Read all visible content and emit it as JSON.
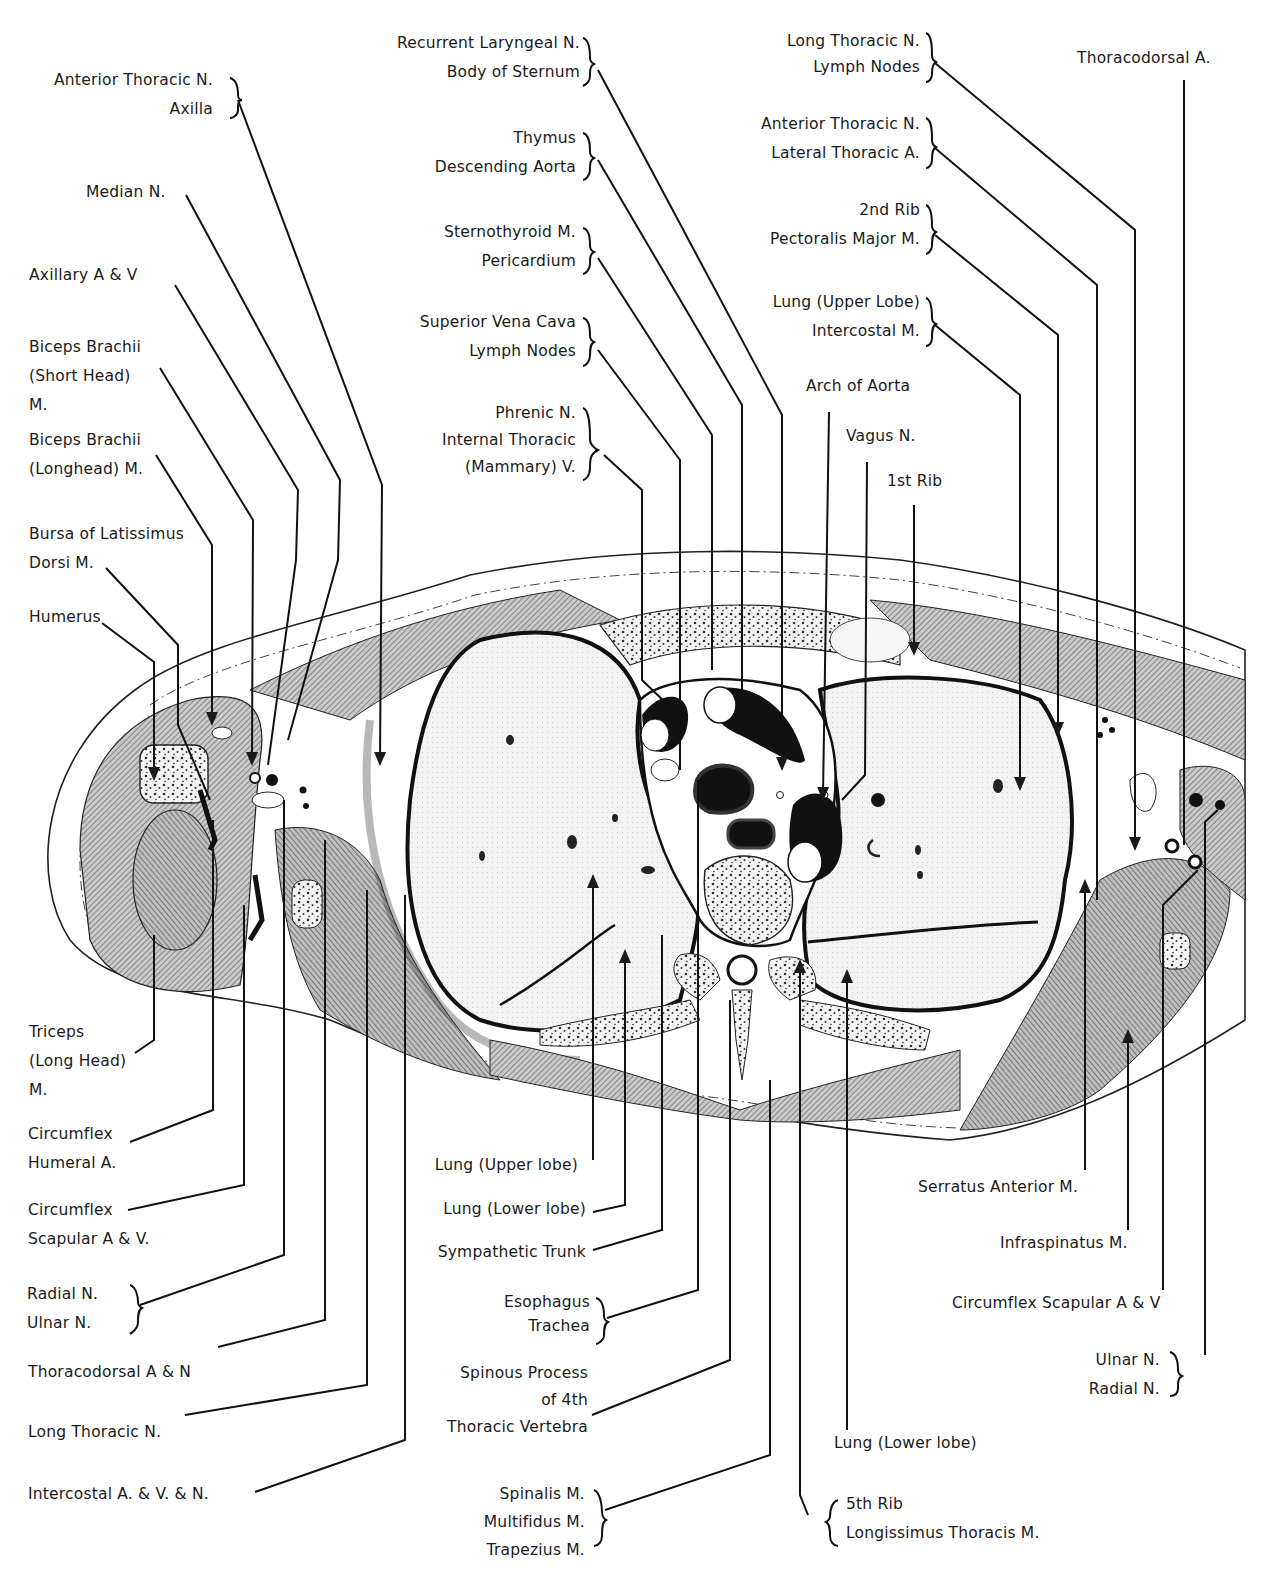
{
  "figure": {
    "type": "anatomical cross-section",
    "colors": {
      "ink": "#1a1a1a",
      "muscle_hatch": "#5a5a5a",
      "lung_fill": "#f2f2f2",
      "background": "#ffffff"
    }
  },
  "labels": {
    "left": [
      {
        "id": "ant-thoracic-axilla",
        "lines": [
          "Anterior Thoracic N.",
          "Axilla"
        ],
        "bracket": true
      },
      {
        "id": "median-n",
        "lines": [
          "Median N."
        ]
      },
      {
        "id": "axillary-av",
        "lines": [
          "Axillary A & V"
        ]
      },
      {
        "id": "biceps-short",
        "lines": [
          "Biceps Brachii",
          "(Short Head)",
          "M."
        ]
      },
      {
        "id": "biceps-long",
        "lines": [
          "Biceps Brachii",
          "(Longhead) M."
        ]
      },
      {
        "id": "bursa-latissimus",
        "lines": [
          "Bursa of Latissimus",
          "Dorsi M."
        ]
      },
      {
        "id": "humerus",
        "lines": [
          "Humerus"
        ]
      },
      {
        "id": "triceps-long",
        "lines": [
          "Triceps",
          "(Long Head)",
          "M."
        ]
      },
      {
        "id": "circumflex-humeral",
        "lines": [
          "Circumflex",
          "Humeral A."
        ]
      },
      {
        "id": "circumflex-scapular-left",
        "lines": [
          "Circumflex",
          "Scapular A & V."
        ]
      },
      {
        "id": "radial-ulnar-left",
        "lines": [
          "Radial N.",
          "Ulnar N."
        ],
        "bracket": true
      },
      {
        "id": "thoracodorsal-an",
        "lines": [
          "Thoracodorsal A & N"
        ]
      },
      {
        "id": "long-thoracic-left",
        "lines": [
          "Long Thoracic N."
        ]
      },
      {
        "id": "intercostal-avn",
        "lines": [
          "Intercostal A. & V. & N."
        ]
      }
    ],
    "top_center": [
      {
        "id": "recurrent-laryngeal",
        "lines": [
          "Recurrent Laryngeal N.",
          "Body of Sternum"
        ],
        "bracket": true
      },
      {
        "id": "thymus-aorta",
        "lines": [
          "Thymus",
          "Descending Aorta"
        ],
        "bracket": true
      },
      {
        "id": "sternothyroid",
        "lines": [
          "Sternothyroid M.",
          "Pericardium"
        ],
        "bracket": true
      },
      {
        "id": "svc-lymph",
        "lines": [
          "Superior Vena Cava",
          "Lymph Nodes"
        ],
        "bracket": true
      },
      {
        "id": "phrenic",
        "lines": [
          "Phrenic N.",
          "Internal Thoracic",
          "(Mammary) V."
        ],
        "bracket": true
      }
    ],
    "top_right": [
      {
        "id": "long-thoracic-lymph",
        "lines": [
          "Long Thoracic N.",
          "Lymph Nodes"
        ],
        "bracket": true
      },
      {
        "id": "thoracodorsal-a",
        "lines": [
          "Thoracodorsal A."
        ]
      },
      {
        "id": "ant-thoracic-lateral",
        "lines": [
          "Anterior Thoracic N.",
          "Lateral Thoracic A."
        ],
        "bracket": true
      },
      {
        "id": "rib2-pectoralis",
        "lines": [
          "2nd Rib",
          "Pectoralis Major M."
        ],
        "bracket": true
      },
      {
        "id": "lung-upper-intercostal",
        "lines": [
          "Lung (Upper Lobe)",
          "Intercostal M."
        ],
        "bracket": true
      },
      {
        "id": "arch-aorta",
        "lines": [
          "Arch of Aorta"
        ]
      },
      {
        "id": "vagus",
        "lines": [
          "Vagus N."
        ]
      },
      {
        "id": "rib1",
        "lines": [
          "1st Rib"
        ]
      }
    ],
    "bottom_center": [
      {
        "id": "lung-upper-lobe",
        "lines": [
          "Lung (Upper lobe)"
        ]
      },
      {
        "id": "lung-lower-lobe-left",
        "lines": [
          "Lung (Lower lobe)"
        ]
      },
      {
        "id": "sympathetic-trunk",
        "lines": [
          "Sympathetic Trunk"
        ]
      },
      {
        "id": "esophagus-trachea",
        "lines": [
          "Esophagus",
          "Trachea"
        ],
        "bracket": true
      },
      {
        "id": "spinous-process",
        "lines": [
          "Spinous Process",
          "of 4th",
          "Thoracic Vertebra"
        ]
      },
      {
        "id": "spinalis-group",
        "lines": [
          "Spinalis M.",
          "Multifidus M.",
          "Trapezius M."
        ],
        "bracket": true
      }
    ],
    "bottom_right": [
      {
        "id": "serratus-anterior",
        "lines": [
          "Serratus Anterior M."
        ]
      },
      {
        "id": "infraspinatus",
        "lines": [
          "Infraspinatus M."
        ]
      },
      {
        "id": "circumflex-scapular-right",
        "lines": [
          "Circumflex Scapular A & V"
        ]
      },
      {
        "id": "ulnar-radial-right",
        "lines": [
          "Ulnar N.",
          "Radial N."
        ],
        "bracket": true
      },
      {
        "id": "lung-lower-lobe-right",
        "lines": [
          "Lung (Lower lobe)"
        ]
      },
      {
        "id": "rib5-longissimus",
        "lines": [
          "5th Rib",
          "Longissimus Thoracis M."
        ],
        "bracket": true
      }
    ]
  }
}
